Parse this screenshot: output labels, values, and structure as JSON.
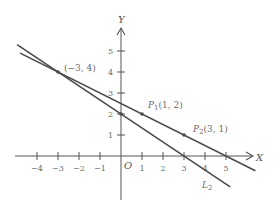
{
  "diagram": {
    "axes": {
      "x_label": "X",
      "y_label": "Y",
      "origin_label": "O",
      "x_ticks": [
        -4,
        -3,
        -2,
        -1,
        1,
        2,
        3,
        4,
        5
      ],
      "x_tick_labels": [
        "−4",
        "−3",
        "−2",
        "−1",
        "1",
        "2",
        "3",
        "4",
        "5"
      ],
      "y_ticks": [
        1,
        2,
        3,
        4,
        5
      ],
      "y_tick_labels": [
        "1",
        "2",
        "3",
        "4",
        "5"
      ],
      "x_range": [
        -5.2,
        6.8
      ],
      "y_range": [
        -2.5,
        6.5
      ]
    },
    "lines": [
      {
        "name": "L1",
        "slope": -0.5,
        "intercept": 2.5,
        "x_from": -4.8,
        "x_to": 6.4
      },
      {
        "name": "L2",
        "slope": -0.6667,
        "intercept": 2,
        "x_from": -4.95,
        "x_to": 5.2,
        "label": "L",
        "label_sub": "2"
      }
    ],
    "points": [
      {
        "x": -3,
        "y": 4,
        "label": "(−3, 4)"
      },
      {
        "x": 1,
        "y": 2,
        "label_main": "P",
        "label_sub": "1",
        "label_coords": "(1, 2)"
      },
      {
        "x": 3,
        "y": 1,
        "label_main": "P",
        "label_sub": "2",
        "label_coords": "(3, 1)"
      },
      {
        "x": 0,
        "y": 2
      }
    ],
    "colors": {
      "line": "#4a4a4a",
      "axis": "#555555",
      "text": "#6a6a6a"
    }
  }
}
